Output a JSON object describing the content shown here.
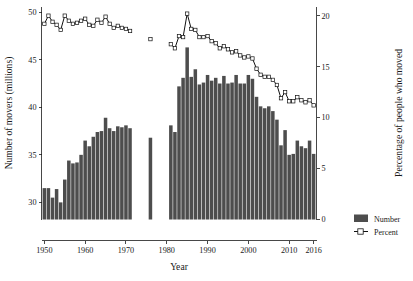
{
  "chart_data": {
    "type": "bar",
    "title": "",
    "xlabel": "Year",
    "ylabel": "Number of movers (millions)",
    "y2label": "Percentage of people who moved",
    "xlim": [
      1949.3,
      2016.7
    ],
    "ylim": [
      28.2,
      50.6
    ],
    "y2lim": [
      0,
      20.9
    ],
    "grid": false,
    "legend_position": "right",
    "xticks": [
      "1950",
      "1960",
      "1970",
      "1980",
      "1990",
      "2000",
      "2010",
      "2016"
    ],
    "xtick_values": [
      1950,
      1960,
      1970,
      1980,
      1990,
      2000,
      2010,
      2016
    ],
    "yticks": [
      "30",
      "35",
      "40",
      "45",
      "50"
    ],
    "ytick_values": [
      30,
      35,
      40,
      45,
      50
    ],
    "y2ticks": [
      "0",
      "5",
      "10",
      "15",
      "20"
    ],
    "y2tick_values": [
      0,
      5,
      10,
      15,
      20
    ],
    "series": [
      {
        "name": "Number",
        "type": "bar",
        "axis": "left",
        "unit": "millions",
        "x": [
          1950,
          1951,
          1952,
          1953,
          1954,
          1955,
          1956,
          1957,
          1958,
          1959,
          1960,
          1961,
          1962,
          1963,
          1964,
          1965,
          1966,
          1967,
          1968,
          1969,
          1970,
          1971,
          1976,
          1981,
          1982,
          1983,
          1984,
          1985,
          1986,
          1987,
          1988,
          1989,
          1990,
          1991,
          1992,
          1993,
          1994,
          1995,
          1996,
          1997,
          1998,
          1999,
          2000,
          2001,
          2002,
          2003,
          2004,
          2005,
          2006,
          2007,
          2008,
          2009,
          2010,
          2011,
          2012,
          2013,
          2014,
          2015,
          2016
        ],
        "values": [
          31.5,
          31.5,
          30.5,
          31.4,
          30.0,
          32.4,
          34.4,
          34.1,
          34.2,
          35.0,
          36.5,
          35.9,
          36.9,
          37.4,
          37.5,
          38.9,
          37.8,
          37.5,
          38.0,
          37.9,
          38.1,
          37.8,
          36.8,
          38.1,
          37.4,
          42.2,
          43.1,
          46.3,
          43.2,
          44.0,
          42.4,
          42.6,
          43.4,
          42.8,
          43.1,
          42.5,
          43.3,
          42.5,
          42.6,
          43.4,
          42.5,
          42.5,
          43.4,
          43.0,
          41.1,
          40.1,
          39.9,
          40.1,
          39.6,
          38.7,
          36.0,
          37.6,
          35.0,
          35.1,
          36.5,
          35.9,
          35.7,
          36.5,
          35.1
        ]
      },
      {
        "name": "Percent",
        "type": "line",
        "axis": "right",
        "unit": "percent",
        "x": [
          1950,
          1951,
          1952,
          1953,
          1954,
          1955,
          1956,
          1957,
          1958,
          1959,
          1960,
          1961,
          1962,
          1963,
          1964,
          1965,
          1966,
          1967,
          1968,
          1969,
          1970,
          1971,
          1976,
          1981,
          1982,
          1983,
          1984,
          1985,
          1986,
          1987,
          1988,
          1989,
          1990,
          1991,
          1992,
          1993,
          1994,
          1995,
          1996,
          1997,
          1998,
          1999,
          2000,
          2001,
          2002,
          2003,
          2004,
          2005,
          2006,
          2007,
          2008,
          2009,
          2010,
          2011,
          2012,
          2013,
          2014,
          2015,
          2016
        ],
        "values": [
          19.2,
          20.0,
          19.4,
          19.1,
          18.6,
          20.0,
          19.5,
          19.2,
          19.3,
          19.5,
          19.7,
          19.1,
          19.0,
          19.6,
          19.3,
          19.9,
          19.2,
          18.8,
          19.0,
          18.8,
          18.7,
          18.5,
          17.7,
          17.2,
          16.8,
          18.0,
          17.9,
          20.2,
          18.7,
          18.6,
          17.9,
          17.9,
          18.0,
          17.5,
          17.3,
          16.8,
          17.0,
          16.7,
          16.4,
          16.5,
          16.1,
          15.9,
          16.0,
          15.8,
          14.8,
          14.2,
          14.0,
          14.0,
          13.7,
          13.2,
          11.9,
          12.5,
          11.6,
          11.6,
          12.0,
          11.7,
          11.5,
          11.7,
          11.2
        ]
      }
    ],
    "annotations": [
      {
        "label": "data-gap",
        "note": "No data shown for 1972-1975 and 1977-1980"
      }
    ]
  },
  "legend": {
    "items": [
      {
        "label": "Number",
        "marker": "bar-swatch",
        "color": "#4d4d4d"
      },
      {
        "label": "Percent",
        "marker": "line-square",
        "color": "#111111"
      }
    ]
  },
  "caption": {
    "text": ""
  }
}
